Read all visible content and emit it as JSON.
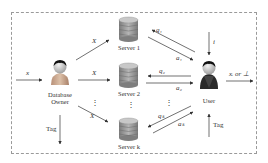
{
  "diagram": {
    "type": "private-information-retrieval-system",
    "nodes": {
      "database_owner": {
        "label_line1": "Database",
        "label_line2": "Owner"
      },
      "servers": [
        {
          "label": "Server 1"
        },
        {
          "label": "Server 2"
        },
        {
          "label": "Server k"
        }
      ],
      "user": {
        "label": "User"
      }
    },
    "edges": {
      "input_x": "x",
      "owner_to_server_1": "X",
      "owner_to_server_2": "X",
      "owner_to_server_k": "X",
      "owner_tag": "Tag",
      "user_query_1": "q₁",
      "user_answer_1": "a₁",
      "user_query_2": "q₂",
      "user_answer_2": "a₂",
      "user_query_k": "qₖ",
      "user_answer_k": "aₖ",
      "user_index_in": "i",
      "user_tag_in": "Tag",
      "user_output": "xᵢ or ⊥"
    },
    "ellipsis": "⋮",
    "colors": {
      "server_fill": "#9a9a9a",
      "owner_body": "#c8a890",
      "user_body": "#2a2a2a",
      "arrow": "#333333",
      "frame": "#9a9a9a"
    }
  }
}
